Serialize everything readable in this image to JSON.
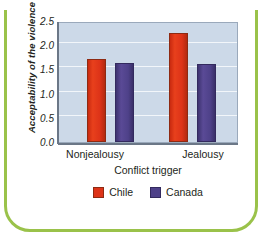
{
  "chart_data": {
    "type": "bar",
    "title": "",
    "xlabel": "Conflict trigger",
    "ylabel": "Acceptability of the violence",
    "categories": [
      "Nonjealousy",
      "Jealousy"
    ],
    "series": [
      {
        "name": "Chile",
        "color": "#dd3318",
        "values": [
          1.67,
          2.22
        ]
      },
      {
        "name": "Canada",
        "color": "#4e4189",
        "values": [
          1.6,
          1.58
        ]
      }
    ],
    "ylim": [
      0.0,
      2.5
    ],
    "ytick_labels": [
      "2.5",
      "2.0",
      "1.5",
      "1.0",
      "0.5",
      "0.0"
    ],
    "ytick_values": [
      2.5,
      2.0,
      1.5,
      1.0,
      0.5,
      0.0
    ],
    "grid": true,
    "legend_position": "bottom-center",
    "plot_background_color": "#ccd9e8",
    "gridline_color": "#f2f6fa",
    "frame_color": "#9ac24a"
  },
  "legend": {
    "items": [
      {
        "label": "Chile"
      },
      {
        "label": "Canada"
      }
    ]
  }
}
